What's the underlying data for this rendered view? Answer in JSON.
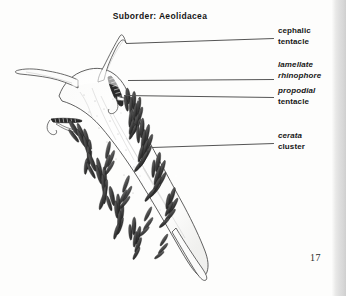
{
  "page": {
    "background_color": "#fdfdfc",
    "number": "17",
    "edge_shadow_color": "#d8d8d8"
  },
  "figure": {
    "title": "Suborder: Aeolidacea",
    "ink_color": "#1a1a1a",
    "leader_line_color": "#555555",
    "labels": [
      {
        "id": "cephalic-tentacle",
        "line1": "cephalic",
        "line2": "tentacle",
        "line1_style": "normal",
        "line2_style": "normal",
        "leader": {
          "x1": 126,
          "y1": 43,
          "x2": 274,
          "y2": 38
        }
      },
      {
        "id": "lamellate-rhinophore",
        "line1": "lamellate",
        "line2": "rhinophore",
        "line1_style": "italic",
        "line2_style": "italic",
        "leader": {
          "x1": 128,
          "y1": 80,
          "x2": 274,
          "y2": 79
        }
      },
      {
        "id": "propodial-tentacle",
        "line1": "propodial",
        "line2": "tentacle",
        "line1_style": "italic",
        "line2_style": "normal",
        "leader": {
          "x1": 124,
          "y1": 95,
          "x2": 274,
          "y2": 97
        }
      },
      {
        "id": "cerata-cluster",
        "line1": "cerata",
        "line2": "cluster",
        "line1_style": "italic",
        "line2_style": "normal",
        "leader": {
          "x1": 152,
          "y1": 147,
          "x2": 274,
          "y2": 143
        }
      }
    ]
  }
}
